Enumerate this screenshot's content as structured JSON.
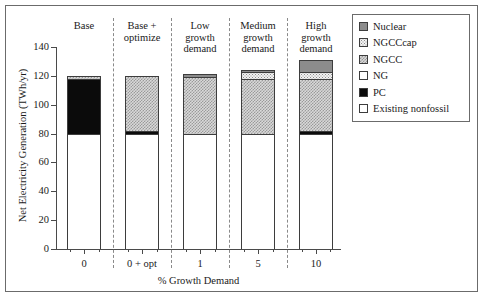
{
  "chart_data": {
    "type": "bar",
    "title": "",
    "xlabel": "% Growth Demand",
    "ylabel": "Net Electricity Generation (TWh/yr)",
    "ylim": [
      0,
      140
    ],
    "yticks": [
      0,
      20,
      40,
      60,
      80,
      100,
      120,
      140
    ],
    "grid": false,
    "legend_position": "top-right",
    "stacked": true,
    "categories": [
      "0",
      "0 + opt",
      "1",
      "5",
      "10"
    ],
    "column_headings": [
      "Base",
      "Base +\noptimize",
      "Low\ngrowth\ndemand",
      "Medium\ngrowth\ndemand",
      "High\ngrowth\ndemand"
    ],
    "series": [
      {
        "name": "Existing nonfossil",
        "values": [
          80,
          80,
          80,
          80,
          80
        ]
      },
      {
        "name": "PC",
        "values": [
          38,
          2,
          0,
          0,
          2
        ]
      },
      {
        "name": "NG",
        "values": [
          0,
          0,
          0,
          0,
          0
        ]
      },
      {
        "name": "NGCC",
        "values": [
          2,
          38,
          39,
          38,
          36
        ]
      },
      {
        "name": "NGCCcap",
        "values": [
          0,
          0,
          0,
          5,
          5
        ]
      },
      {
        "name": "Nuclear",
        "values": [
          0,
          0,
          2,
          1,
          8
        ]
      }
    ],
    "totals": [
      120,
      120,
      121,
      124,
      131
    ]
  },
  "axis": {
    "y_title": "Net Electricity Generation (TWh/yr)",
    "x_title": "% Growth Demand",
    "y_tick_labels": [
      "140",
      "120",
      "100",
      "80",
      "60",
      "40",
      "20",
      "0"
    ],
    "x_tick_labels": [
      "0",
      "0 + opt",
      "1",
      "5",
      "10"
    ]
  },
  "headings": [
    {
      "line1": "Base",
      "line2": "",
      "line3": ""
    },
    {
      "line1": "Base +",
      "line2": "optimize",
      "line3": ""
    },
    {
      "line1": "Low",
      "line2": "growth",
      "line3": "demand"
    },
    {
      "line1": "Medium",
      "line2": "growth",
      "line3": "demand"
    },
    {
      "line1": "High",
      "line2": "growth",
      "line3": "demand"
    }
  ],
  "legend": {
    "items": [
      {
        "label": "Nuclear",
        "swatch": "nuclear-swatch"
      },
      {
        "label": "NGCCcap",
        "swatch": "ngcccap-swatch"
      },
      {
        "label": "NGCC",
        "swatch": "ngcc-swatch"
      },
      {
        "label": "NG",
        "swatch": "ng-swatch"
      },
      {
        "label": "PC",
        "swatch": "pc-swatch"
      },
      {
        "label": "Existing nonfossil",
        "swatch": "existing-nonfossil-swatch"
      }
    ]
  },
  "colors": {
    "nuclear": "#8c8c8c",
    "ngcccap": "#f2f2f2",
    "ngcc": "#d9d9d9",
    "ng": "#ffffff",
    "pc": "#0b0b0b",
    "existing_nonfossil": "#ffffff",
    "axis": "#4a4a4a",
    "frame": "#6b6b6b"
  }
}
